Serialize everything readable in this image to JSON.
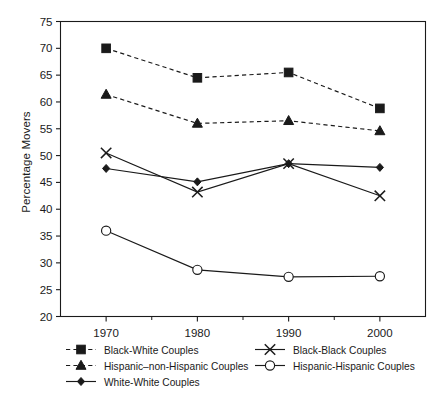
{
  "chart_data": {
    "type": "line",
    "title": "",
    "xlabel": "",
    "ylabel": "Percentage Movers",
    "categories": [
      "1970",
      "1980",
      "1990",
      "2000"
    ],
    "x": [
      1970,
      1980,
      1990,
      2000
    ],
    "xlim": [
      1965,
      2005
    ],
    "ylim": [
      20,
      75
    ],
    "yticks": [
      20,
      25,
      30,
      35,
      40,
      45,
      50,
      55,
      60,
      65,
      70,
      75
    ],
    "ytick_labels": [
      "20",
      "25",
      "30",
      "35",
      "40",
      "45",
      "50",
      "55",
      "60",
      "65",
      "70",
      "75"
    ],
    "xticks": [
      1970,
      1980,
      1990,
      2000
    ],
    "xtick_labels": [
      "1970",
      "1980",
      "1990",
      "2000"
    ],
    "grid": false,
    "legend_position": "below",
    "series": [
      {
        "name": "Black-White Couples",
        "marker": "square-filled",
        "linestyle": "dashed",
        "values": [
          70.0,
          64.5,
          65.5,
          58.8
        ]
      },
      {
        "name": "Hispanic–non-Hispanic Couples",
        "marker": "triangle-filled",
        "linestyle": "dashed",
        "values": [
          61.4,
          56.0,
          56.5,
          54.6
        ]
      },
      {
        "name": "White-White Couples",
        "marker": "diamond-filled",
        "linestyle": "solid",
        "values": [
          47.6,
          45.1,
          48.5,
          47.8
        ]
      },
      {
        "name": "Black-Black Couples",
        "marker": "x-cross",
        "linestyle": "solid",
        "values": [
          50.5,
          43.2,
          48.5,
          42.5
        ]
      },
      {
        "name": "Hispanic-Hispanic Couples",
        "marker": "circle-open",
        "linestyle": "solid",
        "values": [
          36.0,
          28.7,
          27.4,
          27.5
        ]
      }
    ]
  },
  "legend": {
    "column_left": [
      "Black-White Couples",
      "Hispanic–non-Hispanic Couples",
      "White-White Couples"
    ],
    "column_right": [
      "Black-Black Couples",
      "Hispanic-Hispanic Couples"
    ]
  },
  "colors": {
    "ink": "#1a1a1a",
    "background": "#ffffff"
  }
}
